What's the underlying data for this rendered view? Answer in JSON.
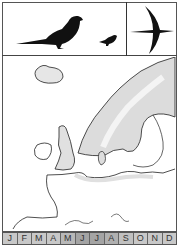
{
  "illustration": {
    "birds": [
      {
        "name": "perched-bird-large",
        "pose": "perched"
      },
      {
        "name": "perched-bird-small",
        "pose": "perched"
      },
      {
        "name": "bird-in-flight",
        "pose": "flying"
      }
    ]
  },
  "map": {
    "region": "Northern Europe",
    "range_color": "#d8d8d8",
    "land_outline_color": "#222222"
  },
  "months": {
    "items": [
      {
        "label": "J",
        "color": "#c8c8c8"
      },
      {
        "label": "F",
        "color": "#c8c8c8"
      },
      {
        "label": "M",
        "color": "#c8c8c8"
      },
      {
        "label": "A",
        "color": "#c8c8c8"
      },
      {
        "label": "M",
        "color": "#b8b8b8"
      },
      {
        "label": "J",
        "color": "#a4a4a4"
      },
      {
        "label": "J",
        "color": "#a4a4a4"
      },
      {
        "label": "A",
        "color": "#b0b0b0"
      },
      {
        "label": "S",
        "color": "#c0c0c0"
      },
      {
        "label": "O",
        "color": "#c8c8c8"
      },
      {
        "label": "N",
        "color": "#c8c8c8"
      },
      {
        "label": "D",
        "color": "#c8c8c8"
      }
    ]
  }
}
